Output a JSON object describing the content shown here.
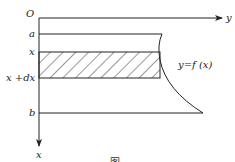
{
  "diagram": {
    "origin_label": "O",
    "horizontal_axis_label": "y",
    "vertical_axis_label": "x",
    "level_labels": {
      "a": "a",
      "x": "x",
      "x_dx": "x +dx",
      "b": "b"
    },
    "curve_label": "y=f (x)",
    "caption": "图",
    "colors": {
      "stroke": "#222222",
      "hatch": "#333333",
      "background": "#ffffff"
    }
  }
}
